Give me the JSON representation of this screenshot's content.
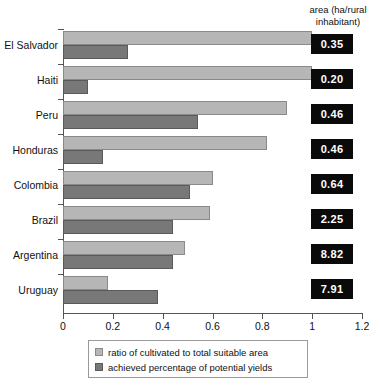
{
  "header": {
    "area_label_line1": "area (ha/rural",
    "area_label_line2": "inhabitant)"
  },
  "legend": {
    "items": [
      {
        "label": "ratio of cultivated to total suitable area",
        "swatch": "light-gray-swatch",
        "color": "#b6b6b6"
      },
      {
        "label": "achieved percentage of potential yields",
        "swatch": "dark-gray-swatch",
        "color": "#787878"
      }
    ]
  },
  "axis": {
    "ticks": [
      "0",
      "0.2",
      "0.4",
      "0.6",
      "0.8",
      "1",
      "1.2"
    ]
  },
  "chart_data": {
    "type": "bar",
    "orientation": "horizontal",
    "title": "",
    "xlabel": "",
    "ylabel": "",
    "xlim": [
      0,
      1.2
    ],
    "grid": false,
    "legend_position": "bottom",
    "categories": [
      "El Salvador",
      "Haiti",
      "Peru",
      "Honduras",
      "Colombia",
      "Brazil",
      "Argentina",
      "Uruguay"
    ],
    "series": [
      {
        "name": "ratio of cultivated to total suitable area",
        "color": "#b6b6b6",
        "values": [
          1.0,
          1.0,
          0.9,
          0.82,
          0.6,
          0.59,
          0.49,
          0.18
        ]
      },
      {
        "name": "achieved percentage of potential yields",
        "color": "#787878",
        "values": [
          0.26,
          0.1,
          0.54,
          0.16,
          0.51,
          0.44,
          0.44,
          0.38
        ]
      }
    ],
    "annotations": {
      "column_header": "area (ha/rural inhabitant)",
      "values": [
        "0.35",
        "0.20",
        "0.46",
        "0.46",
        "0.64",
        "2.25",
        "8.82",
        "7.91"
      ]
    }
  }
}
